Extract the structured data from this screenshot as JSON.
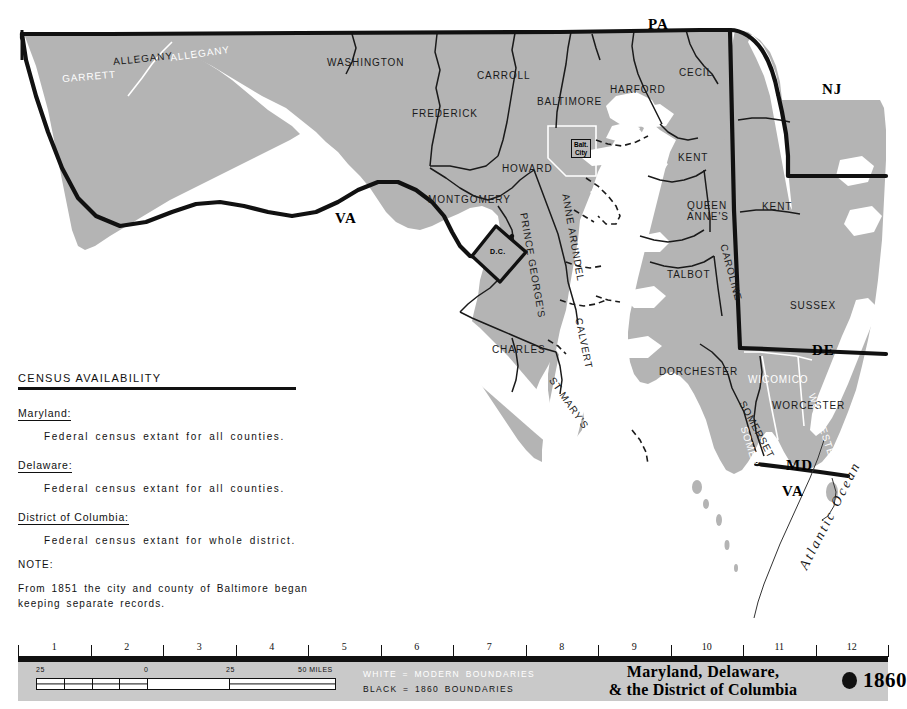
{
  "map": {
    "states": [
      {
        "id": "pa",
        "label": "PA",
        "x": 648,
        "y": 16
      },
      {
        "id": "nj",
        "label": "NJ",
        "x": 822,
        "y": 81
      },
      {
        "id": "va-west",
        "label": "VA",
        "x": 335,
        "y": 210
      },
      {
        "id": "de",
        "label": "DE",
        "x": 812,
        "y": 342
      },
      {
        "id": "md-shore",
        "label": "MD",
        "x": 786,
        "y": 457
      },
      {
        "id": "va-shore",
        "label": "VA",
        "x": 782,
        "y": 483
      }
    ],
    "counties_black": [
      {
        "id": "allegany-1860",
        "label": "ALLEGANY",
        "x": 113,
        "y": 53,
        "rot": -6
      },
      {
        "id": "washington",
        "label": "WASHINGTON",
        "x": 327,
        "y": 57,
        "rot": 0
      },
      {
        "id": "carroll",
        "label": "CARROLL",
        "x": 477,
        "y": 70,
        "rot": 0
      },
      {
        "id": "frederick",
        "label": "FREDERICK",
        "x": 412,
        "y": 108,
        "rot": 0
      },
      {
        "id": "baltimore",
        "label": "BALTIMORE",
        "x": 537,
        "y": 96,
        "rot": 0
      },
      {
        "id": "harford",
        "label": "HARFORD",
        "x": 610,
        "y": 84,
        "rot": 0
      },
      {
        "id": "cecil",
        "label": "CECIL",
        "x": 679,
        "y": 67,
        "rot": 0
      },
      {
        "id": "howard",
        "label": "HOWARD",
        "x": 502,
        "y": 163,
        "rot": 0
      },
      {
        "id": "montgomery",
        "label": "MONTGOMERY",
        "x": 428,
        "y": 194,
        "rot": 0
      },
      {
        "id": "kent-md",
        "label": "KENT",
        "x": 678,
        "y": 152,
        "rot": 0
      },
      {
        "id": "queen-annes-1",
        "label": "QUEEN",
        "x": 687,
        "y": 200,
        "rot": 0
      },
      {
        "id": "queen-annes-2",
        "label": "ANNE'S",
        "x": 687,
        "y": 211,
        "rot": 0
      },
      {
        "id": "talbot",
        "label": "TALBOT",
        "x": 667,
        "y": 269,
        "rot": 0
      },
      {
        "id": "caroline",
        "label": "CAROLINE",
        "x": 729,
        "y": 243,
        "rot": 75
      },
      {
        "id": "kent-de",
        "label": "KENT",
        "x": 762,
        "y": 201,
        "rot": 0
      },
      {
        "id": "sussex",
        "label": "SUSSEX",
        "x": 790,
        "y": 300,
        "rot": 0
      },
      {
        "id": "dorchester",
        "label": "DORCHESTER",
        "x": 659,
        "y": 366,
        "rot": 0
      },
      {
        "id": "somerset-1860",
        "label": "SOMERSET",
        "x": 747,
        "y": 399,
        "rot": 62
      },
      {
        "id": "worcester-1860",
        "label": "WORCESTER",
        "x": 772,
        "y": 400,
        "rot": 0
      },
      {
        "id": "anne-arundel",
        "label": "ANNE ARUNDEL",
        "x": 571,
        "y": 193,
        "rot": 80
      },
      {
        "id": "prince-georges",
        "label": "PRINCE GEORGE'S",
        "x": 529,
        "y": 212,
        "rot": 80
      },
      {
        "id": "calvert",
        "label": "CALVERT",
        "x": 584,
        "y": 317,
        "rot": 78
      },
      {
        "id": "charles",
        "label": "CHARLES",
        "x": 492,
        "y": 344,
        "rot": 0
      },
      {
        "id": "st-marys",
        "label": "ST MARY'S",
        "x": 556,
        "y": 375,
        "rot": 55
      }
    ],
    "counties_white": [
      {
        "id": "garrett",
        "label": "GARRETT",
        "x": 62,
        "y": 71,
        "rot": -5
      },
      {
        "id": "allegany-modern",
        "label": "ALLEGANY",
        "x": 170,
        "y": 48,
        "rot": -8
      },
      {
        "id": "wicomico",
        "label": "WICOMICO",
        "x": 748,
        "y": 374,
        "rot": 0
      },
      {
        "id": "worcester-modern",
        "label": "WORCESTER",
        "x": 817,
        "y": 392,
        "rot": 72
      },
      {
        "id": "somerset-modern",
        "label": "SOMERSET",
        "x": 749,
        "y": 425,
        "rot": 72
      }
    ],
    "dc": {
      "label": "D.C.",
      "x": 506,
      "y": 249
    },
    "baltimore_city": {
      "line1": "Balt.",
      "line2": "City",
      "x": 574,
      "y": 144
    },
    "ocean": {
      "label": "Atlantic Ocean",
      "x": 796,
      "y": 570
    }
  },
  "census": {
    "heading": "CENSUS AVAILABILITY",
    "entries": [
      {
        "state": "Maryland:",
        "body": "Federal census extant for all counties."
      },
      {
        "state": "Delaware:",
        "body": "Federal census extant for all counties."
      },
      {
        "state": "District of Columbia:",
        "body": "Federal census extant for whole district."
      }
    ],
    "note_heading": "NOTE:",
    "note_body": "From 1851 the city and county of Baltimore began keeping separate records."
  },
  "ruler": {
    "numbers": [
      "1",
      "2",
      "3",
      "4",
      "5",
      "6",
      "7",
      "8",
      "9",
      "10",
      "11",
      "12"
    ]
  },
  "scale": {
    "left_label": "25",
    "zero_label": "0",
    "mid_label": "25",
    "right_label": "50 MILES"
  },
  "legend": {
    "white_line": "WHITE  =  MODERN BOUNDARIES",
    "black_line": "BLACK  =  1860 BOUNDARIES"
  },
  "title": {
    "line1": "Maryland,  Delaware,",
    "line2": "& the District of Columbia",
    "year": "1860"
  },
  "colors": {
    "land": "#b4b4b4",
    "water": "#ffffff",
    "band": "#c9c9c9",
    "ink": "#111111"
  }
}
